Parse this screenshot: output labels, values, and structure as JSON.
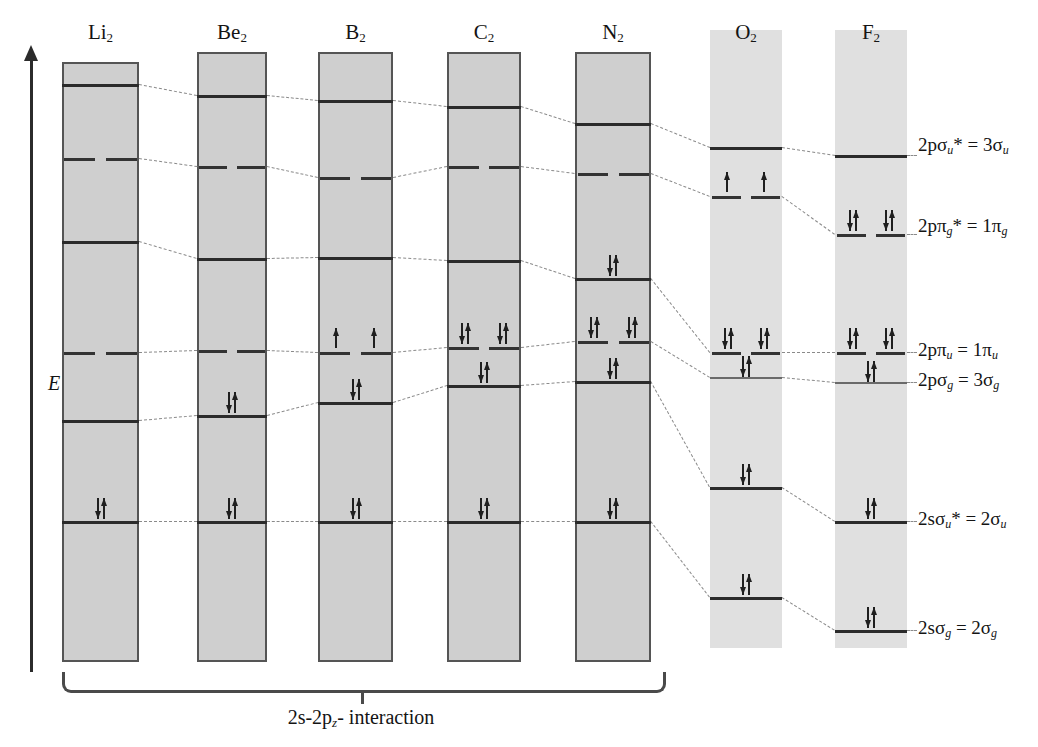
{
  "figure": {
    "energy_axis_label": "E",
    "caption": "2s-2p",
    "caption_sub": "z",
    "caption_tail": "- interaction"
  },
  "columns": [
    {
      "name": "Li2",
      "label": "Li",
      "sub": "2",
      "shaded": "bordered",
      "x": 62,
      "w": 77,
      "top": 62,
      "bottom": 662
    },
    {
      "name": "Be2",
      "label": "Be",
      "sub": "2",
      "shaded": "bordered",
      "x": 197,
      "w": 70,
      "top": 52,
      "bottom": 662
    },
    {
      "name": "B2",
      "label": "B",
      "sub": "2",
      "shaded": "bordered",
      "x": 318,
      "w": 75,
      "top": 52,
      "bottom": 662
    },
    {
      "name": "C2",
      "label": "C",
      "sub": "2",
      "shaded": "bordered",
      "x": 447,
      "w": 74,
      "top": 52,
      "bottom": 662
    },
    {
      "name": "N2",
      "label": "N",
      "sub": "2",
      "shaded": "bordered",
      "x": 575,
      "w": 76,
      "top": 52,
      "bottom": 662
    },
    {
      "name": "O2",
      "label": "O",
      "sub": "2",
      "shaded": "plain",
      "x": 710,
      "w": 72,
      "top": 30,
      "bottom": 648
    },
    {
      "name": "F2",
      "label": "F",
      "sub": "2",
      "shaded": "plain",
      "x": 835,
      "w": 72,
      "top": 30,
      "bottom": 648
    }
  ],
  "header_y": 22,
  "mo_labels": [
    {
      "text_a": "2pσ",
      "sub_a": "u",
      "star": "*",
      "text_b": " = 3σ",
      "sub_b": "u",
      "y": 147,
      "x": 918
    },
    {
      "text_a": "2pπ",
      "sub_a": "g",
      "star": "*",
      "text_b": " = 1π",
      "sub_b": "g",
      "y": 228,
      "x": 918
    },
    {
      "text_a": "2pπ",
      "sub_a": "u",
      "star": "",
      "text_b": " = 1π",
      "sub_b": "u",
      "y": 352,
      "x": 918
    },
    {
      "text_a": "2pσ",
      "sub_a": "g",
      "star": "",
      "text_b": " = 3σ",
      "sub_b": "g",
      "y": 382,
      "x": 918
    },
    {
      "text_a": "2sσ",
      "sub_a": "u",
      "star": "*",
      "text_b": " = 2σ",
      "sub_b": "u",
      "y": 521,
      "x": 918
    },
    {
      "text_a": "2sσ",
      "sub_a": "g",
      "star": "",
      "text_b": " = 2σ",
      "sub_b": "g",
      "y": 630,
      "x": 918
    }
  ],
  "levels": [
    {
      "col": "Li2",
      "mo": "3su",
      "y": 84,
      "style": "full",
      "electrons": ""
    },
    {
      "col": "Li2",
      "mo": "1pg",
      "y": 158,
      "style": "dashed",
      "electrons": ""
    },
    {
      "col": "Li2",
      "mo": "1pu",
      "y": 241,
      "style": "full",
      "electrons": ""
    },
    {
      "col": "Li2",
      "mo": "3sg",
      "y": 352,
      "style": "dashed",
      "electrons": ""
    },
    {
      "col": "Li2",
      "mo": "2su",
      "y": 420,
      "style": "full",
      "electrons": ""
    },
    {
      "col": "Li2",
      "mo": "2sg",
      "y": 521,
      "style": "full",
      "electrons": "pair"
    },
    {
      "col": "Be2",
      "mo": "3su",
      "y": 95,
      "style": "full",
      "electrons": ""
    },
    {
      "col": "Be2",
      "mo": "1pg",
      "y": 166,
      "style": "dashed",
      "electrons": ""
    },
    {
      "col": "Be2",
      "mo": "1pu",
      "y": 258,
      "style": "full",
      "electrons": ""
    },
    {
      "col": "Be2",
      "mo": "3sg",
      "y": 350,
      "style": "dashed",
      "electrons": ""
    },
    {
      "col": "Be2",
      "mo": "2su",
      "y": 415,
      "style": "full",
      "electrons": "pair"
    },
    {
      "col": "Be2",
      "mo": "2sg",
      "y": 521,
      "style": "full",
      "electrons": "pair"
    },
    {
      "col": "B2",
      "mo": "3su",
      "y": 100,
      "style": "full",
      "electrons": ""
    },
    {
      "col": "B2",
      "mo": "1pg",
      "y": 177,
      "style": "dashed",
      "electrons": ""
    },
    {
      "col": "B2",
      "mo": "1pu",
      "y": 257,
      "style": "full",
      "electrons": ""
    },
    {
      "col": "B2",
      "mo": "3sg",
      "y": 352,
      "style": "dashed",
      "electrons": "single-pair"
    },
    {
      "col": "B2",
      "mo": "2su",
      "y": 402,
      "style": "full",
      "electrons": "pair"
    },
    {
      "col": "B2",
      "mo": "2sg",
      "y": 521,
      "style": "full",
      "electrons": "pair"
    },
    {
      "col": "C2",
      "mo": "3su",
      "y": 106,
      "style": "full",
      "electrons": ""
    },
    {
      "col": "C2",
      "mo": "1pg",
      "y": 166,
      "style": "dashed",
      "electrons": ""
    },
    {
      "col": "C2",
      "mo": "1pu",
      "y": 260,
      "style": "full",
      "electrons": ""
    },
    {
      "col": "C2",
      "mo": "3sg",
      "y": 347,
      "style": "dashed",
      "electrons": "two-pairs"
    },
    {
      "col": "C2",
      "mo": "2su",
      "y": 385,
      "style": "full",
      "electrons": "pair"
    },
    {
      "col": "C2",
      "mo": "2sg",
      "y": 521,
      "style": "full",
      "electrons": "pair"
    },
    {
      "col": "N2",
      "mo": "3su",
      "y": 123,
      "style": "full",
      "electrons": ""
    },
    {
      "col": "N2",
      "mo": "1pg",
      "y": 173,
      "style": "dashed",
      "electrons": ""
    },
    {
      "col": "N2",
      "mo": "1pu",
      "y": 278,
      "style": "full",
      "electrons": "pair-above"
    },
    {
      "col": "N2",
      "mo": "3sg",
      "y": 341,
      "style": "dashed",
      "electrons": "two-pairs"
    },
    {
      "col": "N2",
      "mo": "2su",
      "y": 381,
      "style": "full",
      "electrons": "pair"
    },
    {
      "col": "N2",
      "mo": "2sg",
      "y": 521,
      "style": "full",
      "electrons": "pair"
    },
    {
      "col": "O2",
      "mo": "3su",
      "y": 147,
      "style": "full",
      "electrons": ""
    },
    {
      "col": "O2",
      "mo": "1pg",
      "y": 196,
      "style": "dashed",
      "electrons": "single-pair"
    },
    {
      "col": "O2",
      "mo": "1pu",
      "y": 352,
      "style": "dashed",
      "electrons": "two-pairs"
    },
    {
      "col": "O2",
      "mo": "3sg",
      "y": 377,
      "style": "thin",
      "electrons": "pair-tight"
    },
    {
      "col": "O2",
      "mo": "2su",
      "y": 487,
      "style": "full",
      "electrons": "pair"
    },
    {
      "col": "O2",
      "mo": "2sg",
      "y": 597,
      "style": "full",
      "electrons": "pair"
    },
    {
      "col": "F2",
      "mo": "3su",
      "y": 155,
      "style": "full",
      "electrons": ""
    },
    {
      "col": "F2",
      "mo": "1pg",
      "y": 234,
      "style": "dashed",
      "electrons": "two-pairs"
    },
    {
      "col": "F2",
      "mo": "1pu",
      "y": 352,
      "style": "dashed",
      "electrons": "two-pairs"
    },
    {
      "col": "F2",
      "mo": "3sg",
      "y": 382,
      "style": "thin",
      "electrons": "pair-tight"
    },
    {
      "col": "F2",
      "mo": "2su",
      "y": 521,
      "style": "full",
      "electrons": "pair"
    },
    {
      "col": "F2",
      "mo": "2sg",
      "y": 630,
      "style": "full",
      "electrons": "pair"
    }
  ],
  "bracket": {
    "x": 62,
    "w": 598,
    "y": 672,
    "h": 18,
    "caption_x": 361,
    "caption_y": 706
  },
  "axis": {
    "x": 30,
    "top": 60,
    "bottom": 672,
    "label_y": 372
  },
  "colors": {
    "box_fill_dark": "#cfcfcf",
    "box_fill_light": "#e0e0e0",
    "box_border": "#555555",
    "level_line": "#2b2b2b",
    "connector": "#8a8a8a",
    "text": "#141414"
  }
}
